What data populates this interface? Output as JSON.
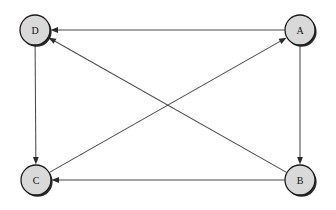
{
  "diagram": {
    "background_color": "#ffffff",
    "node_fill_color": "#d9d9d9",
    "node_stroke_color": "#1a1a1a",
    "node_shadow_color": "#181818",
    "edge_color": "#4a4a4a",
    "arrowhead_color": "#2b2b2b",
    "node_radius": 15,
    "nodes": [
      {
        "id": "D",
        "label": "D",
        "cx": 35,
        "cy": 30
      },
      {
        "id": "A",
        "label": "A",
        "cx": 300,
        "cy": 30
      },
      {
        "id": "C",
        "label": "C",
        "cx": 36,
        "cy": 180
      },
      {
        "id": "B",
        "label": "B",
        "cx": 300,
        "cy": 180
      }
    ],
    "edges": [
      {
        "from": "A",
        "to": "D",
        "directed": true,
        "kind": "horizontal-top"
      },
      {
        "from": "A",
        "to": "B",
        "directed": true,
        "kind": "vertical-right"
      },
      {
        "from": "D",
        "to": "C",
        "directed": true,
        "kind": "vertical-left"
      },
      {
        "from": "B",
        "to": "C",
        "directed": true,
        "kind": "horizontal-bottom"
      },
      {
        "from": "B",
        "to": "D",
        "directed": true,
        "kind": "diagonal"
      },
      {
        "from": "C",
        "to": "A",
        "directed": true,
        "kind": "diagonal"
      }
    ]
  }
}
